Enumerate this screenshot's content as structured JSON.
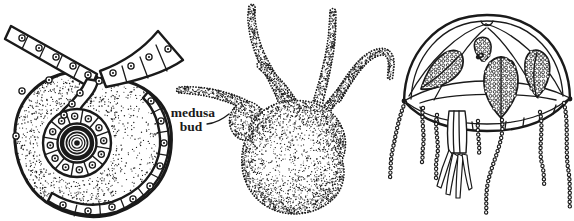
{
  "canvas": {
    "width": 574,
    "height": 221,
    "ink_color": "#1a1a1a",
    "paper_color": "#ffffff"
  },
  "annotations": {
    "medusa_bud_label": {
      "text": "medusa bud",
      "line1": "medusa",
      "line2": "bud"
    }
  }
}
